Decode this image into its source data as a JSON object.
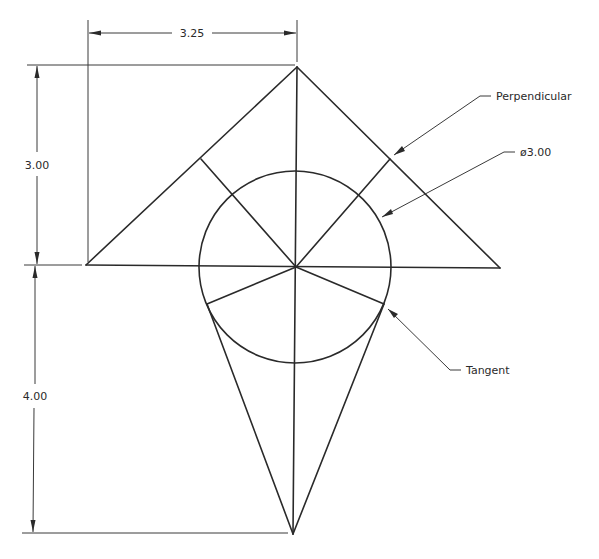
{
  "drawing": {
    "title": "Geometric construction: triangle, inscribed circle and tangent lines",
    "dimensions": {
      "width_top": "3.25",
      "height_upper": "3.00",
      "height_lower": "4.00"
    },
    "callouts": {
      "perpendicular": "Perpendicular",
      "diameter": "ø3.00",
      "tangent": "Tangent"
    },
    "colors": {
      "line": "#2a2a2a",
      "background": "#ffffff"
    }
  }
}
